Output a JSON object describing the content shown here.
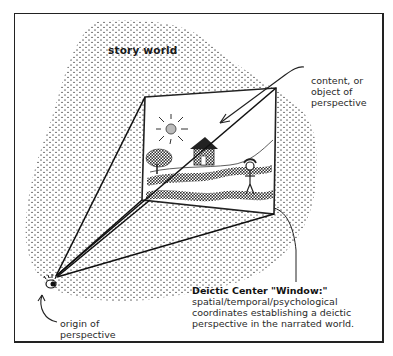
{
  "labels": {
    "story_world": "story world",
    "content_lines": [
      "content, or",
      "object of",
      "perspective"
    ],
    "deictic_title": "Deictic Center \"Window:\"",
    "deictic_lines": [
      "spatial/temporal/psychological",
      "coordinates establishing a deictic",
      "perspective in the narrated world."
    ],
    "origin_lines": [
      "origin of",
      "perspective"
    ]
  },
  "colors": {
    "ink": "#222222",
    "background": "#ffffff",
    "stipple": "#555555"
  },
  "icons": {
    "eye": "eye-icon",
    "sun": "sun-icon",
    "tree": "tree-icon",
    "house": "house-icon",
    "person": "stick-figure-icon"
  }
}
